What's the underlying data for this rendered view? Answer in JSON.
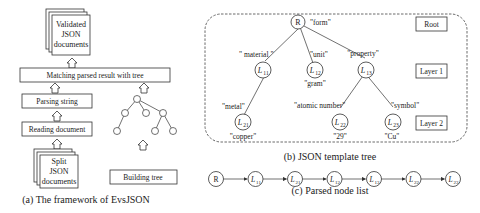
{
  "framework": {
    "caption": "(a) The framework of EvsJSON",
    "validated_docs": [
      "Validated",
      "JSON",
      "documents"
    ],
    "matching": "Matching parsed result with tree",
    "parsing": "Parsing string",
    "reading": "Reading document",
    "split_docs": [
      "Split",
      "JSON",
      "documents"
    ],
    "building": "Building tree"
  },
  "template_tree": {
    "caption": "(b) JSON template tree",
    "layers": [
      "Root",
      "Layer 1",
      "Layer 2"
    ],
    "nodes": {
      "root": {
        "label": "R",
        "value": "\"form\""
      },
      "l11": {
        "label": "L",
        "sub": "11",
        "edge": "\" material \""
      },
      "l12": {
        "label": "L",
        "sub": "12",
        "edge": "\"unit\"",
        "value": "\"gram\""
      },
      "l13": {
        "label": "L",
        "sub": "13",
        "edge": "\"property\""
      },
      "l21": {
        "label": "L",
        "sub": "21",
        "edge": "\"metal\"",
        "value": "\"copper\""
      },
      "l22": {
        "label": "L",
        "sub": "22",
        "edge": "\"atomic number\"",
        "value": "\"29\""
      },
      "l23": {
        "label": "L",
        "sub": "23",
        "edge": "\"symbol\"",
        "value": "\"Cu\""
      }
    }
  },
  "node_list": {
    "caption": "(c) Parsed node list",
    "items": [
      {
        "label": "R",
        "sub": ""
      },
      {
        "label": "L",
        "sub": "11"
      },
      {
        "label": "L",
        "sub": "21"
      },
      {
        "label": "L",
        "sub": "12"
      },
      {
        "label": "L",
        "sub": "13"
      },
      {
        "label": "L",
        "sub": "22"
      },
      {
        "label": "L",
        "sub": "23"
      }
    ]
  }
}
